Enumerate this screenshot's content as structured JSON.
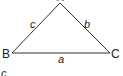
{
  "diagram": {
    "type": "triangle",
    "vertices": {
      "A": {
        "label": "A"
      },
      "B": {
        "label": "B"
      },
      "C": {
        "label": "C"
      }
    },
    "sides": {
      "a": {
        "label": "a",
        "between": [
          "B",
          "C"
        ]
      },
      "b": {
        "label": "b",
        "between": [
          "A",
          "C"
        ]
      },
      "c": {
        "label": "c",
        "between": [
          "A",
          "B"
        ]
      }
    },
    "caption": "c"
  }
}
